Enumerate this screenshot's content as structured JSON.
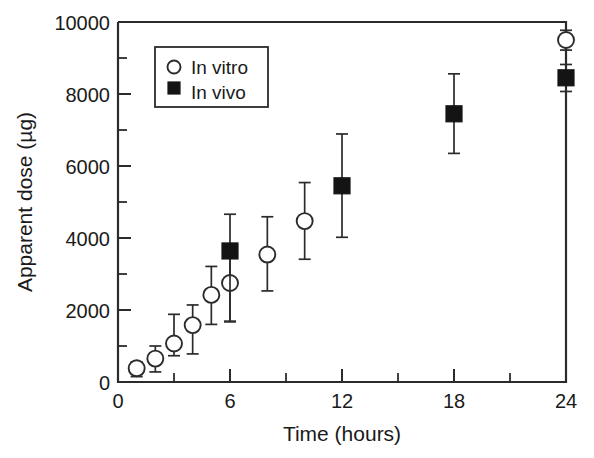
{
  "chart_data": {
    "type": "scatter",
    "title": "",
    "xlabel": "Time (hours)",
    "ylabel": "Apparent dose (µg)",
    "xlim": [
      0,
      24
    ],
    "ylim": [
      0,
      10000
    ],
    "grid": false,
    "legend_position": "top-left-inside",
    "x_ticks": [
      0,
      6,
      12,
      18,
      24
    ],
    "x_tick_labels": [
      "0",
      "6",
      "12",
      "18",
      "24"
    ],
    "x_minor_ticks": [
      3,
      9,
      15,
      21
    ],
    "y_ticks": [
      0,
      2000,
      4000,
      6000,
      8000,
      10000
    ],
    "y_tick_labels": [
      "0",
      "2000",
      "4000",
      "6000",
      "8000",
      "10000"
    ],
    "y_minor_ticks": [
      1000,
      3000,
      5000,
      7000,
      9000
    ],
    "series": [
      {
        "name": "In vitro",
        "marker": "open-circle",
        "x": [
          1,
          2,
          3,
          4,
          5,
          6,
          8,
          10,
          24
        ],
        "values": [
          380,
          650,
          1070,
          1580,
          2420,
          2750,
          3540,
          4470,
          9500
        ],
        "err_low": [
          230,
          370,
          340,
          800,
          820,
          1080,
          1010,
          1060,
          280
        ],
        "err_high": [
          180,
          350,
          810,
          560,
          790,
          1000,
          1050,
          1070,
          270
        ]
      },
      {
        "name": "In vivo",
        "marker": "filled-square",
        "x": [
          6,
          12,
          18,
          24
        ],
        "values": [
          3640,
          5450,
          7450,
          8450
        ],
        "err_low": [
          1950,
          1430,
          1100,
          380
        ],
        "err_high": [
          1020,
          1440,
          1110,
          370
        ]
      }
    ]
  },
  "legend": {
    "entries": [
      {
        "label": "In vitro",
        "marker": "open-circle"
      },
      {
        "label": "In vivo",
        "marker": "filled-square"
      }
    ]
  }
}
